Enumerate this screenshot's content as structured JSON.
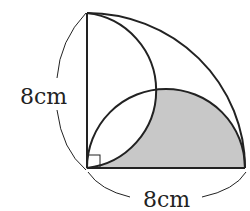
{
  "diagram": {
    "type": "geometry",
    "labels": {
      "vertical_side": "8cm",
      "horizontal_side": "8cm"
    },
    "right_angle_marker": true,
    "shade_color": "#c8c8c8",
    "stroke_color": "#222222"
  }
}
